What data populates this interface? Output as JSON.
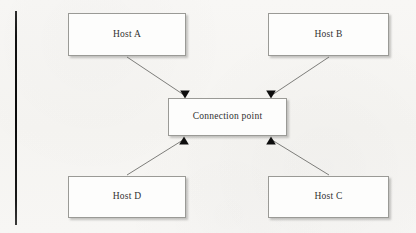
{
  "diagram": {
    "background_color": "#f7f6f4",
    "node_fill_color": "#fdfdfc",
    "node_border_color": "#9a9a96",
    "edge_color": "#6f6f6c",
    "arrowhead_color": "#0d0d0d",
    "margin_rule_color": "#101010"
  },
  "nodes": {
    "host_a": {
      "label": "Host A"
    },
    "host_b": {
      "label": "Host B"
    },
    "connection_point": {
      "label": "Connection point"
    },
    "host_d": {
      "label": "Host D"
    },
    "host_c": {
      "label": "Host C"
    }
  },
  "edges": [
    {
      "name": "host-a-to-connection-point",
      "from": "Host A",
      "to": "Connection point",
      "direction": "to"
    },
    {
      "name": "host-b-to-connection-point",
      "from": "Host B",
      "to": "Connection point",
      "direction": "to"
    },
    {
      "name": "host-d-to-connection-point",
      "from": "Host D",
      "to": "Connection point",
      "direction": "to"
    },
    {
      "name": "host-c-to-connection-point",
      "from": "Host C",
      "to": "Connection point",
      "direction": "to"
    }
  ]
}
